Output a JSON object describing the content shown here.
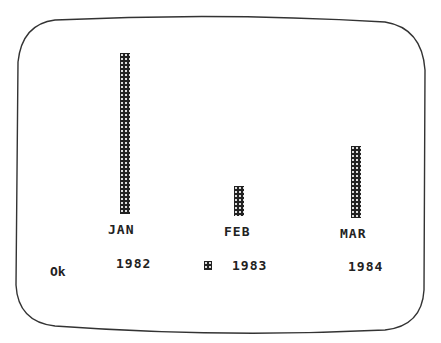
{
  "chart_data": {
    "type": "bar",
    "title": "",
    "xlabel": "",
    "ylabel": "",
    "categories": [
      "JAN",
      "FEB",
      "MAR"
    ],
    "series": [
      {
        "name": "1982",
        "values": [
          128,
          53,
          40
        ],
        "pattern": "fine-dither"
      },
      {
        "name": "1983",
        "values": [
          161,
          30,
          72
        ],
        "pattern": "dark-checker"
      },
      {
        "name": "1984",
        "values": [
          74,
          84,
          62
        ],
        "pattern": "light-dots"
      }
    ],
    "grid": false,
    "legend_position": "bottom",
    "axes_visible": false
  },
  "status": {
    "prompt": "Ok"
  },
  "legend": [
    {
      "label": "1982"
    },
    {
      "label": "1983"
    },
    {
      "label": "1984"
    }
  ],
  "colors": {
    "ink": "#222222",
    "background": "#ffffff",
    "frame": "#333333"
  }
}
